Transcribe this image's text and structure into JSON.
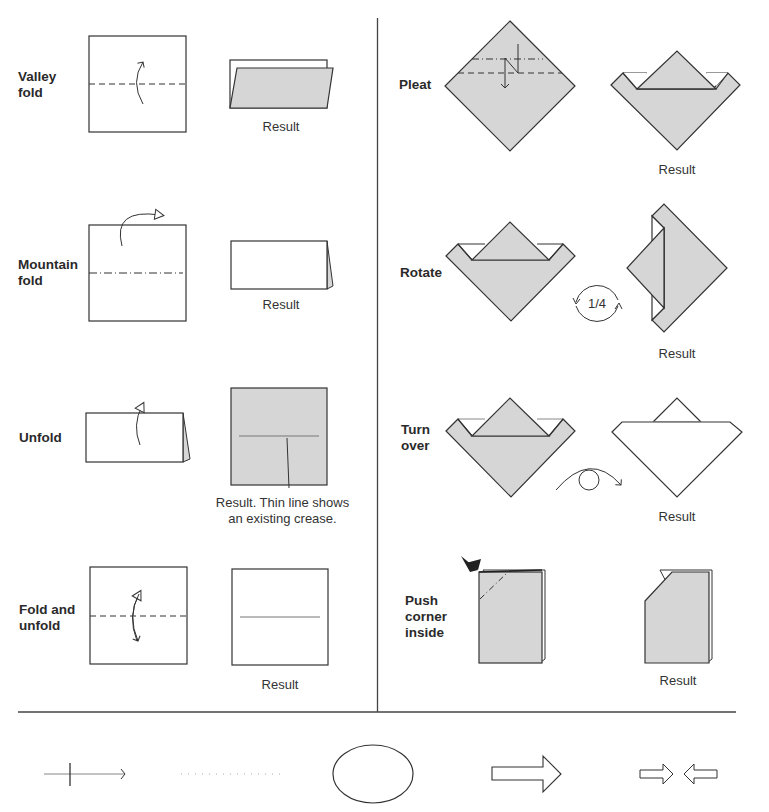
{
  "colors": {
    "paper_colored": "#d6d6d6",
    "paper_white": "#ffffff",
    "stroke": "#333333",
    "text": "#2a2a2a"
  },
  "left_column": [
    {
      "label": "Valley fold",
      "label_lines": [
        "Valley",
        "fold"
      ],
      "result_caption": "Result",
      "diagram": "square-valley-dashed-line-arrow",
      "result": "folded-colored-flap"
    },
    {
      "label": "Mountain fold",
      "label_lines": [
        "Mountain",
        "fold"
      ],
      "result_caption": "Result",
      "diagram": "square-mountain-dash-dot-line-arrow",
      "result": "folded-white-rectangle"
    },
    {
      "label": "Unfold",
      "label_lines": [
        "Unfold"
      ],
      "result_caption_lines": [
        "Result. Thin line shows",
        "an existing crease."
      ],
      "diagram": "folded-rectangle-unfold-arrow",
      "result": "colored-square-with-crease"
    },
    {
      "label": "Fold and unfold",
      "label_lines": [
        "Fold and",
        "unfold"
      ],
      "result_caption": "Result",
      "diagram": "square-dashed-line-double-arrow",
      "result": "white-square-with-crease"
    }
  ],
  "right_column": [
    {
      "label": "Pleat",
      "label_lines": [
        "Pleat"
      ],
      "result_caption": "Result",
      "diagram": "diamond-pleat-lines-z-arrow",
      "result": "boat-shape"
    },
    {
      "label": "Rotate",
      "label_lines": [
        "Rotate"
      ],
      "result_caption": "Result",
      "rotate_symbol_text": "1/4",
      "diagram": "boat-shape",
      "result": "boat-shape-rotated-quarter"
    },
    {
      "label": "Turn over",
      "label_lines": [
        "Turn",
        "over"
      ],
      "result_caption": "Result",
      "diagram": "boat-shape",
      "result": "boat-shape-white-back"
    },
    {
      "label": "Push corner inside",
      "label_lines": [
        "Push",
        "corner",
        "inside"
      ],
      "result_caption": "Result",
      "diagram": "folded-rect-corner-push-arrow",
      "result": "rect-corner-cut"
    }
  ],
  "legend_symbols": [
    {
      "name": "crease-line-with-tick-arrow"
    },
    {
      "name": "dotted-hidden-line"
    },
    {
      "name": "ellipse-enlarge"
    },
    {
      "name": "hollow-arrow-next-step"
    },
    {
      "name": "hollow-arrows-push-together"
    }
  ]
}
